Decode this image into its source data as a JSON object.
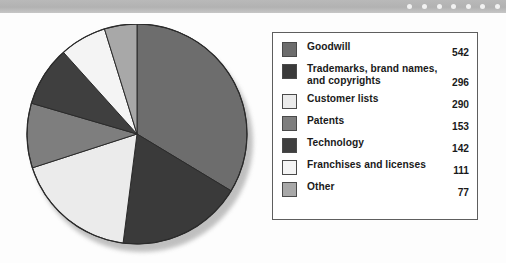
{
  "decor": {
    "band_dot_count": 7,
    "band_color": "#b5b5b5",
    "band_dot_color": "#f2f2f2"
  },
  "legend": {
    "rows": [
      {
        "label": "Goodwill",
        "value": "542",
        "color": "#6d6d6d"
      },
      {
        "label": "Trademarks, brand names, and copyrights",
        "value": "296",
        "color": "#3a3a3a"
      },
      {
        "label": "Customer lists",
        "value": "290",
        "color": "#ebebeb"
      },
      {
        "label": "Patents",
        "value": "153",
        "color": "#7e7e7e"
      },
      {
        "label": "Technology",
        "value": "142",
        "color": "#3f3f3f"
      },
      {
        "label": "Franchises and licenses",
        "value": "111",
        "color": "#f4f4f4"
      },
      {
        "label": "Other",
        "value": "77",
        "color": "#a8a8a8"
      }
    ]
  },
  "chart_data": {
    "type": "pie",
    "title": "",
    "start_angle_deg": 0,
    "direction": "clockwise",
    "total": 1611,
    "units": "",
    "legend_position": "right",
    "labels": [
      "Goodwill",
      "Trademarks, brand names, and copyrights",
      "Customer lists",
      "Patents",
      "Technology",
      "Franchises and licenses",
      "Other"
    ],
    "values": [
      542,
      296,
      290,
      153,
      142,
      111,
      77
    ],
    "colors": [
      "#6d6d6d",
      "#3a3a3a",
      "#ebebeb",
      "#7e7e7e",
      "#3f3f3f",
      "#f4f4f4",
      "#a8a8a8"
    ],
    "percentages": [
      33.6,
      18.4,
      18.0,
      9.5,
      8.8,
      6.9,
      4.8
    ]
  }
}
